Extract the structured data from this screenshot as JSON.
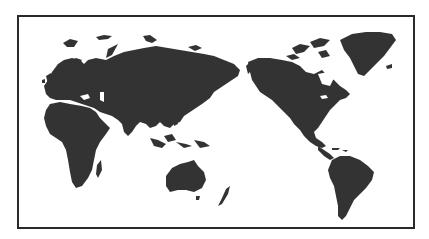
{
  "map": {
    "title": "World map (Pacific-centered)",
    "projection": "Pacific-centered equirectangular",
    "style": {
      "land_color": "#333333",
      "water_color": "#ffffff",
      "border_color": "#2a2a2a"
    },
    "regions": [
      {
        "id": "europe",
        "label": "Europe"
      },
      {
        "id": "asia",
        "label": "Asia"
      },
      {
        "id": "africa",
        "label": "Africa"
      },
      {
        "id": "australia",
        "label": "Australia"
      },
      {
        "id": "north-america",
        "label": "North America"
      },
      {
        "id": "greenland",
        "label": "Greenland"
      },
      {
        "id": "south-america",
        "label": "South America"
      },
      {
        "id": "new-zealand",
        "label": "New Zealand"
      },
      {
        "id": "madagascar",
        "label": "Madagascar"
      },
      {
        "id": "japan",
        "label": "Japan"
      },
      {
        "id": "indonesia",
        "label": "Indonesia"
      }
    ]
  }
}
